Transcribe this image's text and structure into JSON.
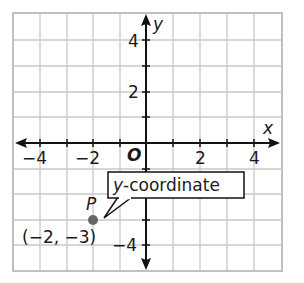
{
  "diagram": {
    "type": "coordinate-plane",
    "axes": {
      "x_label": "x",
      "y_label": "y",
      "origin_label": "O"
    },
    "x_ticks": [
      {
        "value": -4,
        "label": "−4"
      },
      {
        "value": -2,
        "label": "−2"
      },
      {
        "value": 2,
        "label": "2"
      },
      {
        "value": 4,
        "label": "4"
      }
    ],
    "y_ticks": [
      {
        "value": 4,
        "label": "4"
      },
      {
        "value": 2,
        "label": "2"
      },
      {
        "value": -4,
        "label": "−4"
      }
    ],
    "point": {
      "name": "P",
      "coords_label": "(−2, −3)",
      "x": -2,
      "y": -3,
      "color": "#666666"
    },
    "callout": {
      "text_italic": "y",
      "text_rest": "-coordinate"
    },
    "grid_color": "#c8c8c8",
    "axis_color": "#111111"
  }
}
